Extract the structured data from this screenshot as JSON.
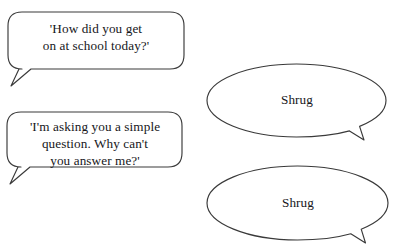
{
  "page": {
    "kind": "speech-bubble-illustration",
    "background_color": "#ffffff",
    "stroke_color": "#3a3a3a",
    "text_color": "#16161a"
  },
  "bubbles": [
    {
      "id": "question-bubble-1",
      "shape": "rounded-rectangle",
      "tail": "bottom-left",
      "speaker": "adult",
      "text": "'How did you get\non at school today?'",
      "lines": [
        "'How did you get",
        "on at school today?'"
      ]
    },
    {
      "id": "question-bubble-2",
      "shape": "rounded-rectangle",
      "tail": "bottom-left",
      "speaker": "adult",
      "text": "'I'm asking you a simple\nquestion. Why can't\nyou answer me?'",
      "lines": [
        "'I'm asking you a simple",
        "question. Why can't",
        "you answer me?'"
      ]
    },
    {
      "id": "response-bubble-1",
      "shape": "ellipse",
      "tail": "bottom-right",
      "speaker": "child",
      "text": "Shrug",
      "lines": [
        "Shrug"
      ]
    },
    {
      "id": "response-bubble-2",
      "shape": "ellipse",
      "tail": "bottom-right",
      "speaker": "child",
      "text": "Shrug",
      "lines": [
        "Shrug"
      ]
    }
  ]
}
